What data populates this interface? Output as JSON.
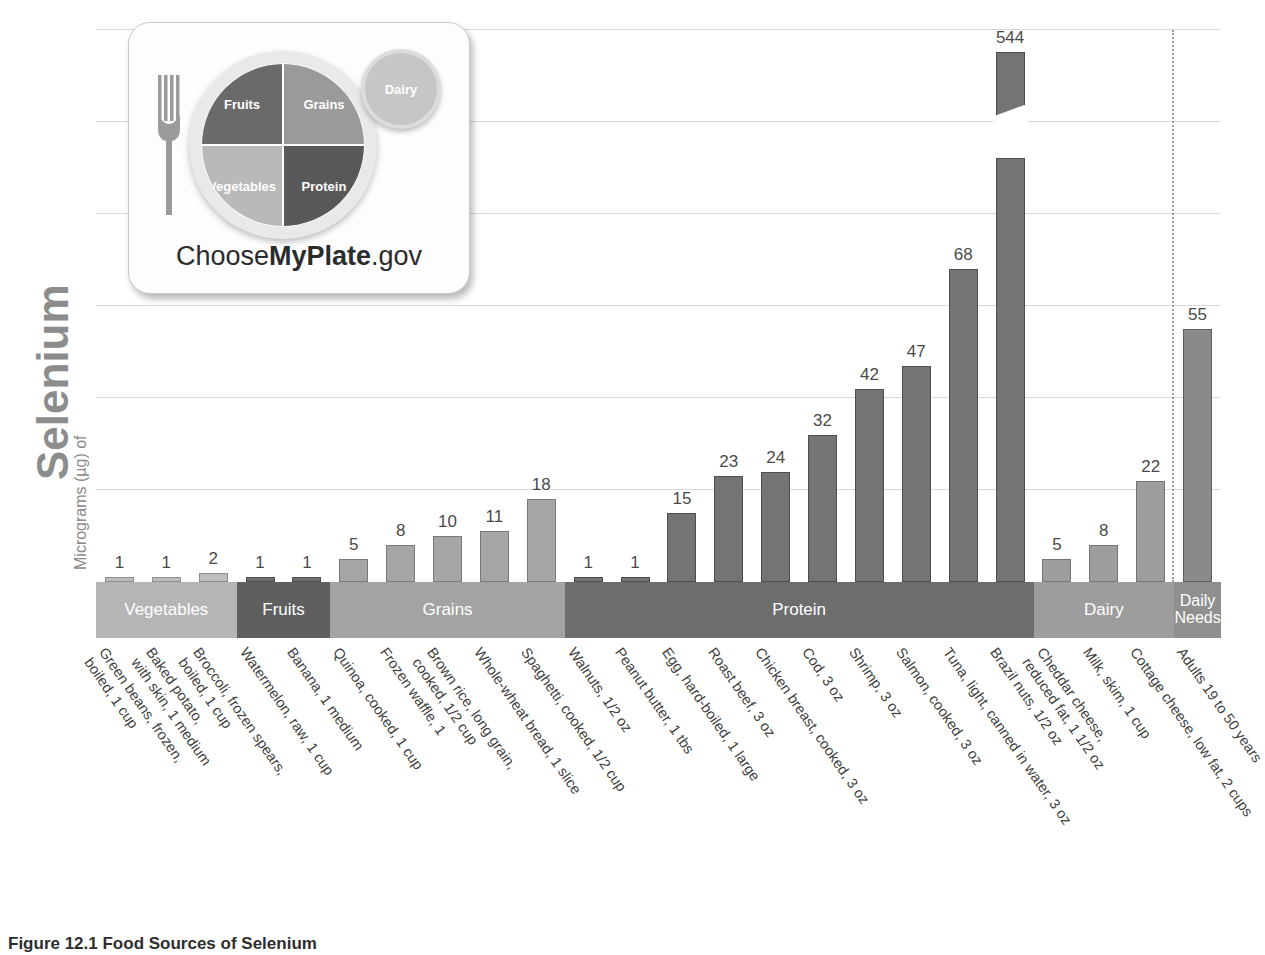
{
  "axis": {
    "title_main": "Selenium",
    "title_prefix": "Micrograms (µg) of"
  },
  "caption": "Figure 12.1  Food Sources of Selenium",
  "logo": {
    "name_part1": "Choose",
    "name_part2": "MyPlate",
    "name_part3": ".gov",
    "fruits": "Fruits",
    "grains": "Grains",
    "vegetables": "Vegetables",
    "protein": "Protein",
    "dairy": "Dairy"
  },
  "categories": [
    {
      "key": "veg",
      "label": "Vegetables",
      "color": "#b5b5b5",
      "count": 3
    },
    {
      "key": "fru",
      "label": "Fruits",
      "color": "#5f5f5f",
      "count": 2
    },
    {
      "key": "gra",
      "label": "Grains",
      "color": "#a3a3a3",
      "count": 5
    },
    {
      "key": "pro",
      "label": "Protein",
      "color": "#6d6d6d",
      "count": 10
    },
    {
      "key": "dai",
      "label": "Dairy",
      "color": "#9d9d9d",
      "count": 3
    },
    {
      "key": "dn",
      "label": "Daily\nNeeds",
      "color": "#8f8f8f",
      "count": 1
    }
  ],
  "chart_data": {
    "type": "bar",
    "title": "Figure 12.1  Food Sources of Selenium",
    "xlabel": "",
    "ylabel": "Micrograms (µg) of Selenium",
    "ylim": [
      0,
      120
    ],
    "grid": true,
    "legend": "none",
    "note": "Brazil nuts bar is truncated with an axis break; actual value 544 µg",
    "categories": [
      "Green beans, frozen, boiled, 1 cup",
      "Baked potato, with skin, 1 medium",
      "Broccoli, frozen spears, boiled, 1 cup",
      "Watermelon, raw, 1 cup",
      "Banana, 1 medium",
      "Quinoa, cooked, 1 cup",
      "Frozen waffle, 1",
      "Brown rice, long grain, cooked, 1/2 cup",
      "Whole-wheat bread, 1 slice",
      "Spaghetti, cooked, 1/2 cup",
      "Walnuts, 1/2 oz",
      "Peanut butter, 1 tbs",
      "Egg, hard-boiled, 1 large",
      "Roast beef, 3 oz",
      "Chicken breast, cooked, 3 oz",
      "Cod, 3 oz",
      "Shrimp, 3 oz",
      "Salmon, cooked, 3 oz",
      "Tuna, light, canned in water, 3 oz",
      "Brazil nuts, 1/2 oz",
      "Cheddar cheese, reduced fat, 1 1/2 oz",
      "Milk, skim, 1 cup",
      "Cottage cheese, low fat, 2 cups",
      "Adults 19 to 50 years"
    ],
    "values": [
      1,
      1,
      2,
      1,
      1,
      5,
      8,
      10,
      11,
      18,
      1,
      1,
      15,
      23,
      24,
      32,
      42,
      47,
      68,
      544,
      5,
      8,
      22,
      55
    ]
  },
  "bars": [
    {
      "group": "veg",
      "value": 1,
      "label": "1",
      "l1": "Green beans, frozen,",
      "l2": "boiled, 1 cup"
    },
    {
      "group": "veg",
      "value": 1,
      "label": "1",
      "l1": "Baked potato,",
      "l2": "with skin, 1 medium"
    },
    {
      "group": "veg",
      "value": 2,
      "label": "2",
      "l1": "Broccoli, frozen spears,",
      "l2": "boiled, 1 cup"
    },
    {
      "group": "fru",
      "value": 1,
      "label": "1",
      "l1": "Watermelon, raw, 1 cup",
      "l2": ""
    },
    {
      "group": "fru",
      "value": 1,
      "label": "1",
      "l1": "Banana, 1 medium",
      "l2": ""
    },
    {
      "group": "gra",
      "value": 5,
      "label": "5",
      "l1": "Quinoa, cooked, 1 cup",
      "l2": ""
    },
    {
      "group": "gra",
      "value": 8,
      "label": "8",
      "l1": "Frozen waffle, 1",
      "l2": ""
    },
    {
      "group": "gra",
      "value": 10,
      "label": "10",
      "l1": "Brown rice, long grain,",
      "l2": "cooked, 1/2 cup"
    },
    {
      "group": "gra",
      "value": 11,
      "label": "11",
      "l1": "Whole-wheat bread, 1 slice",
      "l2": ""
    },
    {
      "group": "gra",
      "value": 18,
      "label": "18",
      "l1": "Spaghetti, cooked, 1/2 cup",
      "l2": ""
    },
    {
      "group": "pro",
      "value": 1,
      "label": "1",
      "l1": "Walnuts, 1/2 oz",
      "l2": ""
    },
    {
      "group": "pro",
      "value": 1,
      "label": "1",
      "l1": "Peanut butter, 1 tbs",
      "l2": ""
    },
    {
      "group": "pro",
      "value": 15,
      "label": "15",
      "l1": "Egg, hard-boiled, 1 large",
      "l2": ""
    },
    {
      "group": "pro",
      "value": 23,
      "label": "23",
      "l1": "Roast beef, 3 oz",
      "l2": ""
    },
    {
      "group": "pro",
      "value": 24,
      "label": "24",
      "l1": "Chicken breast, cooked, 3 oz",
      "l2": ""
    },
    {
      "group": "pro",
      "value": 32,
      "label": "32",
      "l1": "Cod, 3 oz",
      "l2": ""
    },
    {
      "group": "pro",
      "value": 42,
      "label": "42",
      "l1": "Shrimp, 3 oz",
      "l2": ""
    },
    {
      "group": "pro",
      "value": 47,
      "label": "47",
      "l1": "Salmon, cooked, 3 oz",
      "l2": ""
    },
    {
      "group": "pro",
      "value": 68,
      "label": "68",
      "l1": "Tuna, light, canned in water, 3 oz",
      "l2": ""
    },
    {
      "group": "pro",
      "value": 544,
      "label": "544",
      "l1": "Brazil nuts, 1/2 oz",
      "l2": "",
      "broken": true
    },
    {
      "group": "dai",
      "value": 5,
      "label": "5",
      "l1": "Cheddar cheese,",
      "l2": "reduced fat, 1 1/2 oz"
    },
    {
      "group": "dai",
      "value": 8,
      "label": "8",
      "l1": "Milk, skim, 1 cup",
      "l2": ""
    },
    {
      "group": "dai",
      "value": 22,
      "label": "22",
      "l1": "Cottage cheese, low fat, 2 cups",
      "l2": ""
    },
    {
      "group": "dn",
      "value": 55,
      "label": "55",
      "l1": "Adults 19 to 50 years",
      "l2": ""
    }
  ],
  "gridlines": [
    20,
    40,
    60,
    80,
    100,
    120
  ]
}
